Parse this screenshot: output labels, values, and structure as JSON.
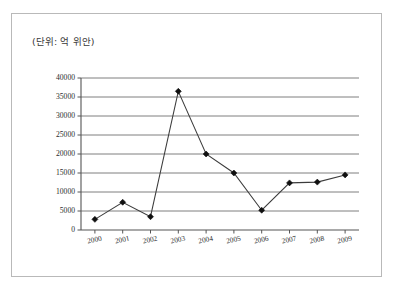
{
  "figure": {
    "unit_label": "(단위: 억 위안)",
    "border_color": "#b9b9b9",
    "background": "#ffffff"
  },
  "chart_data": {
    "type": "line",
    "title": "",
    "subtitle": "",
    "xlabel": "",
    "ylabel": "",
    "unit_note": "(단위: 억 위안)",
    "categories": [
      "2000",
      "2001",
      "2002",
      "2003",
      "2004",
      "2005",
      "2006",
      "2007",
      "2008",
      "2009"
    ],
    "values": [
      2800,
      7300,
      3500,
      36500,
      20000,
      15000,
      5200,
      12400,
      12600,
      14500
    ],
    "series": [
      {
        "name": "",
        "values": [
          2800,
          7300,
          3500,
          36500,
          20000,
          15000,
          5200,
          12400,
          12600,
          14500
        ],
        "color": "#3c3c3c",
        "marker": "diamond",
        "marker_color": "#101010"
      }
    ],
    "ylim": [
      0,
      40000
    ],
    "yticks": [
      0,
      5000,
      10000,
      15000,
      20000,
      25000,
      30000,
      35000,
      40000
    ],
    "ytick_labels": [
      "0",
      "5000",
      "10000",
      "15000",
      "20000",
      "25000",
      "30000",
      "35000",
      "40000"
    ],
    "xticks": [
      "2000",
      "2001",
      "2002",
      "2003",
      "2004",
      "2005",
      "2006",
      "2007",
      "2008",
      "2009"
    ],
    "grid": true,
    "grid_axis": "y",
    "legend": false,
    "legend_position": "none"
  }
}
